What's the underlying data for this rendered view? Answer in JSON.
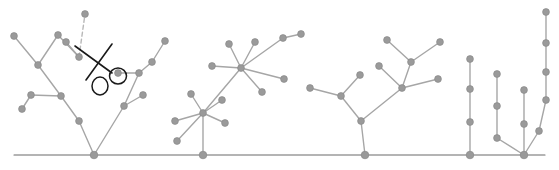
{
  "figure": {
    "title": "",
    "width": 559,
    "height": 170,
    "background_color": "#ffffff"
  },
  "style": {
    "ground_color": "#6b6b6b",
    "ground_width": 1.1,
    "edge_color": "#a6a6a6",
    "edge_width": 1.4,
    "node_color": "#9a9a9a",
    "node_stroke": "#8a8a8a",
    "node_radius": 3.4,
    "root_radius": 3.8,
    "cut_edge_color": "#b8b8b8",
    "cut_edge_dash": "4 3",
    "scissors_color": "#1a1a1a",
    "scissors_width": 1.6
  },
  "ground": {
    "label": "ground-line",
    "y": 155,
    "x_start": 14,
    "x_end": 545
  },
  "trees": [
    {
      "name": "tree-1-branching",
      "root_index": 0,
      "nodes": [
        {
          "id": 0,
          "x": 94,
          "y": 155,
          "label": "root"
        },
        {
          "id": 1,
          "x": 79,
          "y": 121,
          "label": "n1"
        },
        {
          "id": 2,
          "x": 61,
          "y": 96,
          "label": "n2"
        },
        {
          "id": 3,
          "x": 31,
          "y": 95,
          "label": "n3"
        },
        {
          "id": 4,
          "x": 22,
          "y": 109,
          "label": "n4"
        },
        {
          "id": 5,
          "x": 38,
          "y": 65,
          "label": "n5"
        },
        {
          "id": 6,
          "x": 14,
          "y": 36,
          "label": "n6"
        },
        {
          "id": 7,
          "x": 58,
          "y": 35,
          "label": "n7"
        },
        {
          "id": 8,
          "x": 79,
          "y": 57,
          "label": "n8"
        },
        {
          "id": 9,
          "x": 66,
          "y": 42,
          "label": "n9"
        },
        {
          "id": 10,
          "x": 124,
          "y": 106,
          "label": "n10"
        },
        {
          "id": 11,
          "x": 143,
          "y": 95,
          "label": "n11"
        },
        {
          "id": 12,
          "x": 139,
          "y": 73,
          "label": "n12"
        },
        {
          "id": 13,
          "x": 152,
          "y": 62,
          "label": "n13"
        },
        {
          "id": 14,
          "x": 165,
          "y": 41,
          "label": "n14"
        },
        {
          "id": 15,
          "x": 118,
          "y": 73,
          "label": "n15"
        }
      ],
      "edges": [
        [
          0,
          1
        ],
        [
          1,
          2
        ],
        [
          2,
          3
        ],
        [
          3,
          4
        ],
        [
          2,
          5
        ],
        [
          5,
          6
        ],
        [
          5,
          7
        ],
        [
          7,
          8
        ],
        [
          8,
          9
        ],
        [
          0,
          10
        ],
        [
          10,
          11
        ],
        [
          10,
          12
        ],
        [
          12,
          13
        ],
        [
          13,
          14
        ],
        [
          12,
          15
        ]
      ],
      "cut_edge": {
        "from": {
          "x": 79,
          "y": 57
        },
        "to": {
          "x": 85,
          "y": 14
        },
        "label": "dashed-cut-edge"
      },
      "cut_edge_node": {
        "x": 85,
        "y": 14,
        "label": "detached-node"
      }
    },
    {
      "name": "tree-2-star",
      "root_index": 0,
      "nodes": [
        {
          "id": 0,
          "x": 203,
          "y": 155,
          "label": "root"
        },
        {
          "id": 1,
          "x": 203,
          "y": 113,
          "label": "hub-lower"
        },
        {
          "id": 2,
          "x": 175,
          "y": 121,
          "label": "n2"
        },
        {
          "id": 3,
          "x": 177,
          "y": 141,
          "label": "n3"
        },
        {
          "id": 4,
          "x": 191,
          "y": 94,
          "label": "n4"
        },
        {
          "id": 5,
          "x": 225,
          "y": 123,
          "label": "n5"
        },
        {
          "id": 6,
          "x": 222,
          "y": 100,
          "label": "n6"
        },
        {
          "id": 7,
          "x": 241,
          "y": 68,
          "label": "hub-upper"
        },
        {
          "id": 8,
          "x": 212,
          "y": 66,
          "label": "n8"
        },
        {
          "id": 9,
          "x": 229,
          "y": 44,
          "label": "n9"
        },
        {
          "id": 10,
          "x": 255,
          "y": 42,
          "label": "n10"
        },
        {
          "id": 11,
          "x": 283,
          "y": 38,
          "label": "n11"
        },
        {
          "id": 12,
          "x": 301,
          "y": 34,
          "label": "n12"
        },
        {
          "id": 13,
          "x": 284,
          "y": 79,
          "label": "n13"
        },
        {
          "id": 14,
          "x": 262,
          "y": 92,
          "label": "n14"
        }
      ],
      "edges": [
        [
          0,
          1
        ],
        [
          1,
          2
        ],
        [
          1,
          3
        ],
        [
          1,
          4
        ],
        [
          1,
          5
        ],
        [
          1,
          6
        ],
        [
          1,
          7
        ],
        [
          7,
          8
        ],
        [
          7,
          9
        ],
        [
          7,
          10
        ],
        [
          7,
          11
        ],
        [
          11,
          12
        ],
        [
          7,
          13
        ],
        [
          7,
          14
        ]
      ]
    },
    {
      "name": "tree-3-binary",
      "root_index": 0,
      "nodes": [
        {
          "id": 0,
          "x": 365,
          "y": 155,
          "label": "root"
        },
        {
          "id": 1,
          "x": 361,
          "y": 121,
          "label": "n1"
        },
        {
          "id": 2,
          "x": 341,
          "y": 96,
          "label": "n2"
        },
        {
          "id": 3,
          "x": 310,
          "y": 88,
          "label": "n3"
        },
        {
          "id": 4,
          "x": 360,
          "y": 75,
          "label": "n4"
        },
        {
          "id": 5,
          "x": 402,
          "y": 88,
          "label": "n5"
        },
        {
          "id": 6,
          "x": 379,
          "y": 66,
          "label": "n6"
        },
        {
          "id": 7,
          "x": 438,
          "y": 79,
          "label": "n7"
        },
        {
          "id": 8,
          "x": 411,
          "y": 62,
          "label": "n8"
        },
        {
          "id": 9,
          "x": 387,
          "y": 40,
          "label": "n9"
        },
        {
          "id": 10,
          "x": 440,
          "y": 42,
          "label": "n10"
        }
      ],
      "edges": [
        [
          0,
          1
        ],
        [
          1,
          2
        ],
        [
          2,
          3
        ],
        [
          2,
          4
        ],
        [
          1,
          5
        ],
        [
          5,
          6
        ],
        [
          5,
          7
        ],
        [
          5,
          8
        ],
        [
          8,
          9
        ],
        [
          8,
          10
        ]
      ]
    },
    {
      "name": "tree-4-path",
      "root_index": 0,
      "nodes": [
        {
          "id": 0,
          "x": 470,
          "y": 155,
          "label": "root"
        },
        {
          "id": 1,
          "x": 470,
          "y": 122,
          "label": "n1"
        },
        {
          "id": 2,
          "x": 470,
          "y": 89,
          "label": "n2"
        },
        {
          "id": 3,
          "x": 470,
          "y": 59,
          "label": "n3"
        }
      ],
      "edges": [
        [
          0,
          1
        ],
        [
          1,
          2
        ],
        [
          2,
          3
        ]
      ]
    },
    {
      "name": "tree-5-three-branch",
      "root_index": 0,
      "nodes": [
        {
          "id": 0,
          "x": 524,
          "y": 155,
          "label": "root"
        },
        {
          "id": 1,
          "x": 497,
          "y": 138,
          "label": "l1"
        },
        {
          "id": 2,
          "x": 497,
          "y": 106,
          "label": "l2"
        },
        {
          "id": 3,
          "x": 497,
          "y": 74,
          "label": "l3"
        },
        {
          "id": 4,
          "x": 524,
          "y": 124,
          "label": "m1"
        },
        {
          "id": 5,
          "x": 524,
          "y": 90,
          "label": "m2"
        },
        {
          "id": 6,
          "x": 539,
          "y": 131,
          "label": "r1"
        },
        {
          "id": 7,
          "x": 546,
          "y": 100,
          "label": "r2"
        },
        {
          "id": 8,
          "x": 546,
          "y": 72,
          "label": "r3"
        },
        {
          "id": 9,
          "x": 546,
          "y": 43,
          "label": "r4"
        },
        {
          "id": 10,
          "x": 546,
          "y": 12,
          "label": "r5"
        }
      ],
      "edges": [
        [
          0,
          1
        ],
        [
          1,
          2
        ],
        [
          2,
          3
        ],
        [
          0,
          4
        ],
        [
          4,
          5
        ],
        [
          0,
          6
        ],
        [
          6,
          7
        ],
        [
          7,
          8
        ],
        [
          8,
          9
        ],
        [
          9,
          10
        ]
      ]
    }
  ],
  "scissors": {
    "label": "scissors-icon",
    "pivot": {
      "x": 96,
      "y": 62
    },
    "blade_a": {
      "x1": 75,
      "y1": 46,
      "x2": 112,
      "y2": 73
    },
    "blade_b": {
      "x1": 112,
      "y1": 44,
      "x2": 86,
      "y2": 80
    },
    "handle_left": {
      "cx": 100,
      "cy": 86,
      "rx": 8,
      "ry": 9
    },
    "handle_right": {
      "cx": 118,
      "cy": 76,
      "rx": 8.5,
      "ry": 8
    }
  }
}
